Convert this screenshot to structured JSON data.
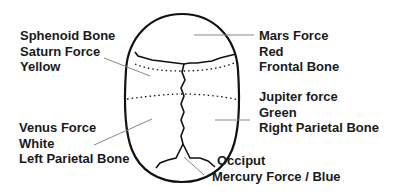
{
  "diagram": {
    "labels": [
      {
        "id": "sphenoid",
        "lines": [
          "Sphenoid Bone",
          "Saturn Force",
          "Yellow"
        ]
      },
      {
        "id": "frontal",
        "lines": [
          "Mars Force",
          "Red",
          "Frontal Bone"
        ]
      },
      {
        "id": "right-parietal",
        "lines": [
          "Jupiter force",
          "Green",
          "Right Parietal Bone"
        ]
      },
      {
        "id": "left-parietal",
        "lines": [
          "Venus Force",
          "White",
          "Left Parietal Bone"
        ]
      },
      {
        "id": "occiput",
        "lines": [
          "Occiput",
          "Mercury Force / Blue"
        ]
      }
    ],
    "colors": {
      "outline": "#111111",
      "leader_line": "#888888",
      "text": "#1a1a1a",
      "background": "#ffffff"
    }
  }
}
